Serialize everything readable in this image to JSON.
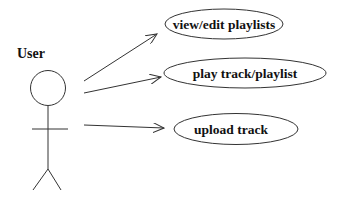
{
  "diagram": {
    "type": "uml-use-case",
    "actor": {
      "label": "User"
    },
    "use_cases": [
      {
        "id": "uc1",
        "label": "view/edit playlists"
      },
      {
        "id": "uc2",
        "label": "play track/playlist"
      },
      {
        "id": "uc3",
        "label": "upload track"
      }
    ],
    "associations": [
      {
        "from": "User",
        "to": "view/edit playlists"
      },
      {
        "from": "User",
        "to": "play track/playlist"
      },
      {
        "from": "User",
        "to": "upload track"
      }
    ],
    "colors": {
      "stroke": "#333333",
      "text": "#111111",
      "background": "#ffffff"
    }
  }
}
